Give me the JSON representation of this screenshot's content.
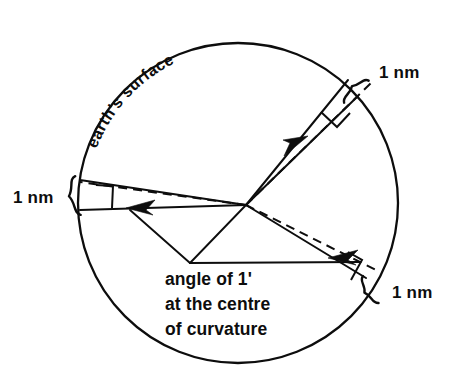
{
  "figure": {
    "background_color": "#ffffff",
    "ink_color": "#0d0d0d"
  },
  "labels": {
    "surface": "earth's  surface",
    "nm_top_right": "1 nm",
    "nm_left": "1 nm",
    "nm_bottom_right": "1 nm",
    "brace_left": "{",
    "caption_line1": "angle of 1'",
    "caption_line2": "at the centre",
    "caption_line3": "of curvature"
  },
  "geometry": {
    "circle": {
      "cx": 238,
      "cy": 203,
      "r": 160,
      "stroke_width": 2.3
    },
    "centre_of_curvature": {
      "x": 246,
      "y": 205
    },
    "apex_lower": {
      "x": 190,
      "y": 263
    },
    "arc_endpoints": {
      "upper_right": {
        "x": 356,
        "y": 92
      },
      "left": {
        "x": 80,
        "y": 218
      },
      "lower_right": {
        "x": 368,
        "y": 292
      }
    },
    "arrow_tips": {
      "upper_right": {
        "x": 303,
        "y": 140
      },
      "left": {
        "x": 128,
        "y": 210
      },
      "lower_right": {
        "x": 330,
        "y": 258
      }
    }
  },
  "annotations": {
    "angle_value": "1'",
    "arc_length": "1 nm",
    "arc_count": 3,
    "description": "Three 1 nautical mile arcs subtending an angle of 1 arcminute at the centre of curvature of the earth"
  }
}
